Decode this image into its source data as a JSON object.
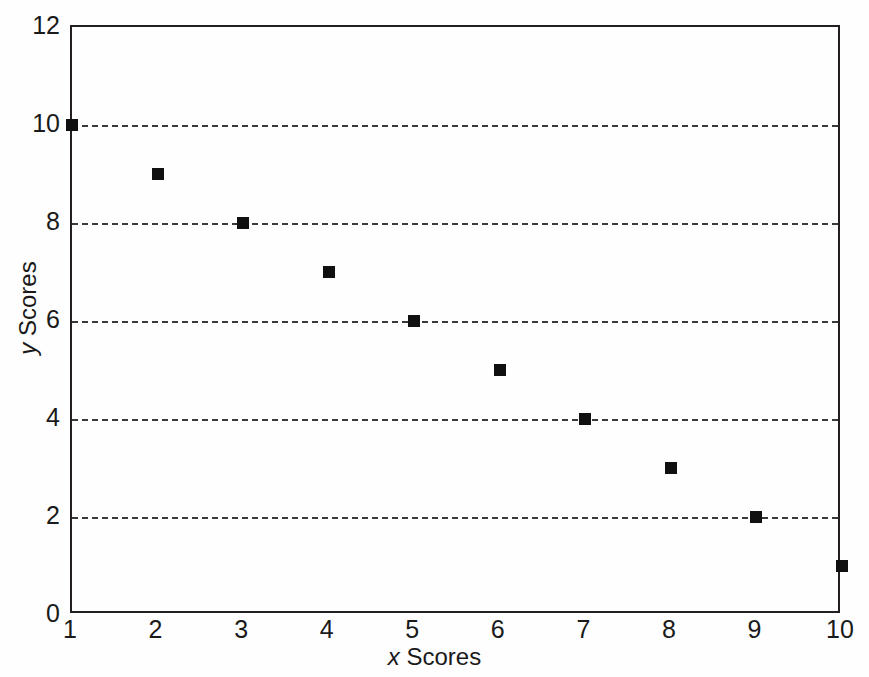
{
  "chart_data": {
    "type": "scatter",
    "title": "",
    "xlabel": "x Scores",
    "ylabel": "y Scores",
    "xlabel_var": "x",
    "xlabel_rest": " Scores",
    "ylabel_var": "y",
    "ylabel_rest": " Scores",
    "x": [
      1,
      2,
      3,
      4,
      5,
      6,
      7,
      8,
      9,
      10
    ],
    "y": [
      10,
      9,
      8,
      7,
      6,
      5,
      4,
      3,
      2,
      1
    ],
    "points": [
      {
        "x": 1,
        "y": 10
      },
      {
        "x": 2,
        "y": 9
      },
      {
        "x": 3,
        "y": 8
      },
      {
        "x": 4,
        "y": 7
      },
      {
        "x": 5,
        "y": 6
      },
      {
        "x": 6,
        "y": 5
      },
      {
        "x": 7,
        "y": 4
      },
      {
        "x": 8,
        "y": 3
      },
      {
        "x": 9,
        "y": 2
      },
      {
        "x": 10,
        "y": 1
      }
    ],
    "xlim": [
      1,
      10
    ],
    "ylim": [
      0,
      12
    ],
    "xticks": [
      1,
      2,
      3,
      4,
      5,
      6,
      7,
      8,
      9,
      10
    ],
    "xtick_labels": [
      "1",
      "2",
      "3",
      "4",
      "5",
      "6",
      "7",
      "8",
      "9",
      "10"
    ],
    "yticks": [
      0,
      2,
      4,
      6,
      8,
      10,
      12
    ],
    "ytick_labels": [
      "0",
      "2",
      "4",
      "6",
      "8",
      "10",
      "12"
    ],
    "gridlines_y": [
      2,
      4,
      6,
      8,
      10
    ],
    "grid": "horizontal-dashed",
    "legend": "none",
    "marker_shape": "square",
    "marker_color": "#101010",
    "frame_color": "#231f20",
    "background_color": "#ffffff"
  }
}
